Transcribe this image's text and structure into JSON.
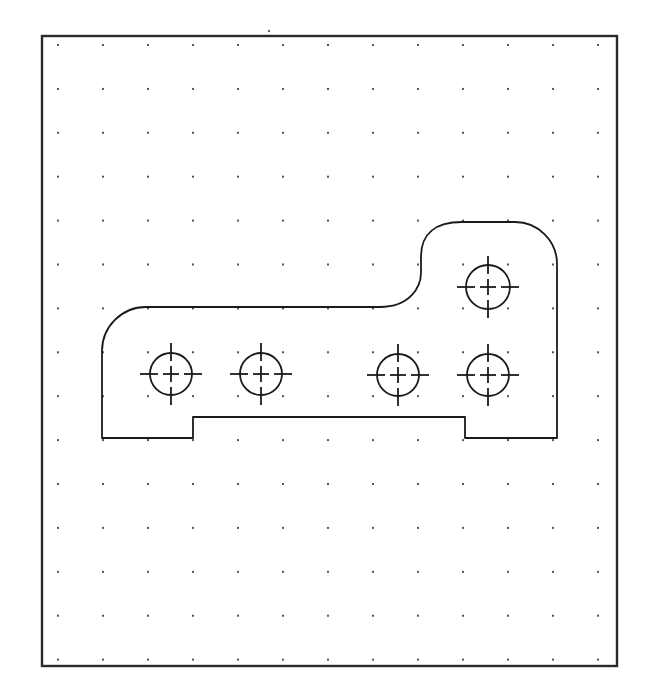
{
  "drawing": {
    "type": "cad-part-sketch",
    "canvas": {
      "width": 654,
      "height": 695,
      "background": "#ffffff"
    },
    "frame": {
      "x": 42,
      "y": 36,
      "width": 575,
      "height": 630,
      "stroke": "#2a2a2a"
    },
    "grid": {
      "dot_color": "#555555",
      "x_start": 58,
      "x_step": 45,
      "cols": 13,
      "y_start": 45,
      "y_step": 43.9,
      "rows": 15
    },
    "stray_dot": {
      "x": 269,
      "y": 31
    },
    "part": {
      "outline_color": "#1a1a1a",
      "outline_description": "L-shaped plate with rounded top-left corner, S-curve transition to raised boss on right, rounded top-right corner, and a rectangular recess along bottom edge",
      "left_x": 102,
      "right_x": 557,
      "bottom_y": 438,
      "top_main_y": 307,
      "top_boss_y": 222,
      "notch": {
        "left_x": 193,
        "right_x": 465,
        "top_y": 417
      },
      "corner_radius_left": 44,
      "corner_radius_right": 42
    },
    "holes": [
      {
        "id": "hole-1",
        "cx": 171,
        "cy": 374,
        "r": 21
      },
      {
        "id": "hole-2",
        "cx": 261,
        "cy": 374,
        "r": 21
      },
      {
        "id": "hole-3",
        "cx": 398,
        "cy": 375,
        "r": 21
      },
      {
        "id": "hole-4",
        "cx": 488,
        "cy": 375,
        "r": 21
      },
      {
        "id": "hole-5",
        "cx": 488,
        "cy": 287,
        "r": 22
      }
    ],
    "centermark": {
      "extend": 31,
      "arm": 8,
      "gap": 5
    }
  }
}
